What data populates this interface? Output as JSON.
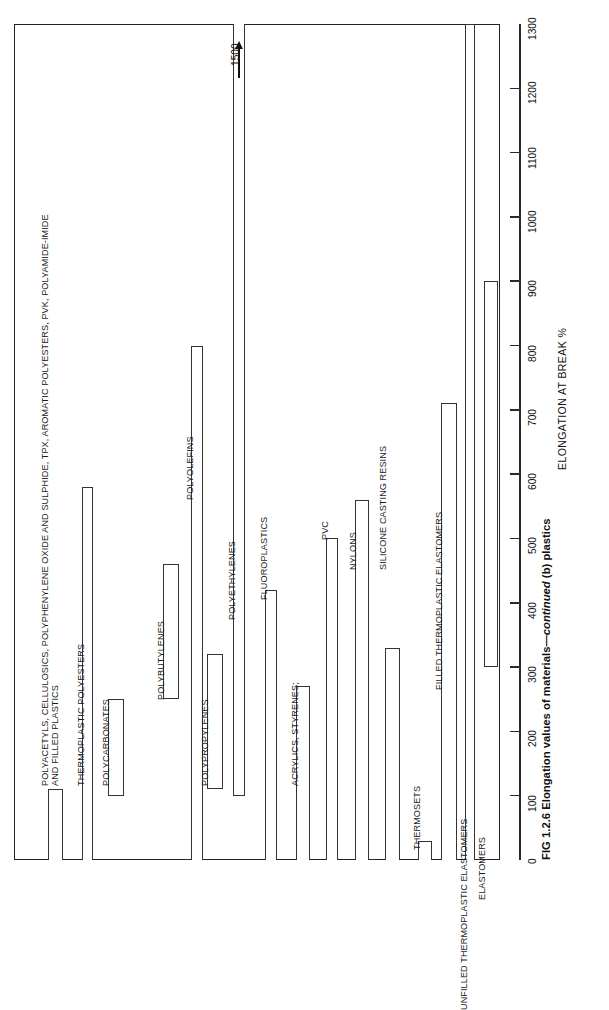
{
  "figure": {
    "caption_prefix": "FIG 1.2.6 Elongation values of materials—",
    "caption_italic": "continued",
    "caption_suffix": " (b) plastics"
  },
  "axis": {
    "title": "ELONGATION AT BREAK %",
    "ticks": [
      "0",
      "100",
      "200",
      "300",
      "400",
      "500",
      "600",
      "700",
      "800",
      "900",
      "1000",
      "1100",
      "1200",
      "1300"
    ],
    "min": 0,
    "max": 1300
  },
  "annotation": {
    "overflow_label": "1500",
    "icon": "up-arrow-icon"
  },
  "chart_data": {
    "type": "bar",
    "orientation": "vertical-rotated",
    "title": "FIG 1.2.6 Elongation values of materials—continued (b) plastics",
    "xlabel": "",
    "ylabel": "ELONGATION AT BREAK %",
    "ylim": [
      0,
      1300
    ],
    "grid": false,
    "legend": "none",
    "note": "Floating/range bars: each category spans from its minimum to its maximum elongation at break (%).",
    "categories": [
      "POLYACETYLS, CELLULOSICS, POLYPHENYLENE OXIDE AND SULPHIDE, TPX, AROMATIC POLYESTERS, PVK, POLYAMIDE-IMIDE AND FILLED PLASTICS",
      "THERMOPLASTIC POLYESTERS",
      "POLYCARBONATES",
      "POLYBUTYLENES",
      "POLYOLEFINS",
      "POLYPROPYLENES",
      "POLYETHYLENES",
      "FLUOROPLASTICS",
      "ACRYLICS, STYRENES;",
      "PVC",
      "NYLONS",
      "SILICONE CASTING RESINS",
      "THERMOSETS",
      "FILLED THERMOPLASTIC ELASTOMERS",
      "UNFILLED THERMOPLASTIC ELASTOMERS",
      "ELASTOMERS"
    ],
    "ranges": [
      {
        "name": "POLYACETYLS, CELLULOSICS, POLYPHENYLENE OXIDE AND SULPHIDE, TPX, AROMATIC POLYESTERS, PVK, POLYAMIDE-IMIDE AND FILLED PLASTICS",
        "min": 0,
        "max": 110
      },
      {
        "name": "THERMOPLASTIC POLYESTERS",
        "min": 0,
        "max": 580
      },
      {
        "name": "POLYCARBONATES",
        "min": 100,
        "max": 250
      },
      {
        "name": "POLYBUTYLENES",
        "min": 250,
        "max": 460
      },
      {
        "name": "POLYOLEFINS",
        "min": 0,
        "max": 800
      },
      {
        "name": "POLYPROPYLENES",
        "min": 110,
        "max": 320
      },
      {
        "name": "POLYETHYLENES",
        "min": 100,
        "max": 1500
      },
      {
        "name": "FLUOROPLASTICS",
        "min": 0,
        "max": 420
      },
      {
        "name": "ACRYLICS, STYRENES;",
        "min": 0,
        "max": 270
      },
      {
        "name": "PVC",
        "min": 0,
        "max": 500
      },
      {
        "name": "NYLONS",
        "min": 0,
        "max": 560
      },
      {
        "name": "SILICONE CASTING RESINS",
        "min": 0,
        "max": 330
      },
      {
        "name": "THERMOSETS",
        "min": 0,
        "max": 30
      },
      {
        "name": "FILLED THERMOPLASTIC ELASTOMERS",
        "min": 0,
        "max": 710
      },
      {
        "name": "UNFILLED THERMOPLASTIC ELASTOMERS",
        "min": 0,
        "max": 1300
      },
      {
        "name": "ELASTOMERS",
        "min": 300,
        "max": 900
      }
    ]
  },
  "bars": [
    {
      "label_line1": "POLYACETYLS, CELLULOSICS, POLYPHENYLENE OXIDE AND SULPHIDE, TPX, AROMATIC POLYESTERS, PVK, POLYAMIDE-IMIDE",
      "label_line2": "AND FILLED PLASTICS",
      "min": 0,
      "max": 110,
      "left": 48,
      "width": 15,
      "label_left": 40,
      "label_top": 786
    },
    {
      "label_line1": "THERMOPLASTIC POLYESTERS",
      "min": 0,
      "max": 580,
      "left": 82,
      "width": 11,
      "label_left": 76,
      "label_top": 786
    },
    {
      "label_line1": "POLYCARBONATES",
      "min": 100,
      "max": 250,
      "left": 108,
      "width": 16,
      "label_left": 101,
      "label_top": 786
    },
    {
      "label_line1": "POLYBUTYLENES",
      "min": 250,
      "max": 460,
      "left": 163,
      "width": 16,
      "label_left": 156,
      "label_top": 700
    },
    {
      "label_line1": "POLYOLEFINS",
      "min": 0,
      "max": 800,
      "left": 191,
      "width": 12,
      "label_left": 185,
      "label_top": 500
    },
    {
      "label_line1": "POLYPROPYLENES",
      "min": 110,
      "max": 320,
      "left": 207,
      "width": 16,
      "label_left": 200,
      "label_top": 786
    },
    {
      "label_line1": "POLYETHYLENES",
      "min": 100,
      "max": 1500,
      "left": 233,
      "width": 12,
      "label_left": 227,
      "label_top": 620
    },
    {
      "label_line1": "FLUOROPLASTICS",
      "min": 0,
      "max": 420,
      "left": 265,
      "width": 12,
      "label_left": 259,
      "label_top": 600
    },
    {
      "label_line1": "ACRYLICS, STYRENES;",
      "min": 0,
      "max": 270,
      "left": 296,
      "width": 14,
      "label_left": 290,
      "label_top": 786
    },
    {
      "label_line1": "PVC",
      "min": 0,
      "max": 500,
      "left": 326,
      "width": 12,
      "label_left": 320,
      "label_top": 540
    },
    {
      "label_line1": "NYLONS",
      "min": 0,
      "max": 560,
      "left": 355,
      "width": 14,
      "label_left": 348,
      "label_top": 570
    },
    {
      "label_line1": "SILICONE CASTING RESINS",
      "min": 0,
      "max": 330,
      "left": 385,
      "width": 15,
      "label_left": 378,
      "label_top": 570
    },
    {
      "label_line1": "THERMOSETS",
      "min": 0,
      "max": 30,
      "left": 418,
      "width": 14,
      "label_left": 412,
      "label_top": 850
    },
    {
      "label_line1": "FILLED THERMOPLASTIC ELASTOMERS",
      "min": 0,
      "max": 710,
      "left": 441,
      "width": 16,
      "label_left": 434,
      "label_top": 690
    },
    {
      "label_line1": "UNFILLED THERMOPLASTIC ELASTOMERS",
      "min": 0,
      "max": 1300,
      "left": 465,
      "width": 10,
      "label_left": 459,
      "label_top": 1010
    },
    {
      "label_line1": "ELASTOMERS",
      "min": 300,
      "max": 900,
      "left": 484,
      "width": 14,
      "label_left": 477,
      "label_top": 900
    }
  ]
}
